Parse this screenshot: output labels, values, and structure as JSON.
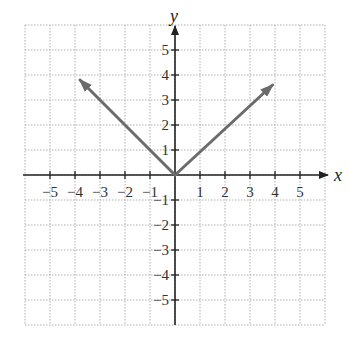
{
  "chart_data": {
    "type": "line",
    "title": "",
    "xlabel": "x",
    "ylabel": "y",
    "xlim": [
      -6,
      6
    ],
    "ylim": [
      -6,
      6
    ],
    "grid": true,
    "x_ticks": [
      -5,
      -4,
      -3,
      -2,
      -1,
      1,
      2,
      3,
      4,
      5
    ],
    "y_ticks": [
      -5,
      -4,
      -3,
      -2,
      -1,
      1,
      2,
      3,
      4,
      5
    ],
    "x_tick_labels": [
      "−5",
      "−4",
      "−3",
      "−2",
      "−1",
      "1",
      "2",
      "3",
      "4",
      "5"
    ],
    "y_tick_labels": [
      "−5",
      "−4",
      "−3",
      "−2",
      "−1",
      "1",
      "2",
      "3",
      "4",
      "5"
    ],
    "series": [
      {
        "name": "left-branch",
        "points": [
          [
            0,
            0
          ],
          [
            -3.8,
            3.8
          ]
        ],
        "arrow_end": true,
        "color": "#6b6b6b"
      },
      {
        "name": "right-branch",
        "points": [
          [
            0,
            0
          ],
          [
            3.9,
            3.6
          ]
        ],
        "arrow_end": true,
        "color": "#6b6b6b"
      }
    ]
  },
  "colors": {
    "grid": "#b0b0b0",
    "axis": "#222222",
    "curve": "#6b6b6b"
  }
}
